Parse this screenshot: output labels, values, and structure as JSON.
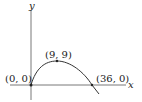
{
  "diagram": {
    "type": "function-graph",
    "axes": {
      "x_label": "x",
      "y_label": "y"
    },
    "points": [
      {
        "label": "(0, 0)",
        "x": 0,
        "y": 0
      },
      {
        "label": "(9, 9)",
        "x": 9,
        "y": 9
      },
      {
        "label": "(36, 0)",
        "x": 36,
        "y": 0
      }
    ],
    "colors": {
      "curve": "#333333",
      "axis": "#555555",
      "text": "#222222"
    }
  }
}
